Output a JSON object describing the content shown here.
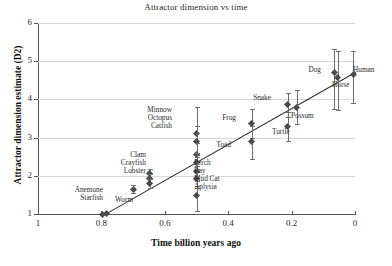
{
  "chart_data": {
    "type": "scatter",
    "title": "Attractor dimension vs time",
    "xlabel": "Time billion years ago",
    "ylabel": "Attractor dimension estimate (D2)",
    "xlim": [
      1,
      0
    ],
    "ylim": [
      1,
      6
    ],
    "x_ticks": [
      "1",
      "0.8",
      "0.6",
      "0.4",
      "0.2",
      "0"
    ],
    "y_ticks": [
      "1",
      "2",
      "3",
      "4",
      "5",
      "6"
    ],
    "x_axis_reversed": true,
    "grid": "horizontal",
    "legend": "none",
    "trendline": {
      "x1": 0.79,
      "y1": 1.0,
      "x2": 0.0,
      "y2": 4.72
    },
    "points": [
      {
        "name": "Anemone",
        "x": 0.795,
        "y": 1.0,
        "err_low": 0.0,
        "err_high": 0.0
      },
      {
        "name": "Starfish",
        "x": 0.785,
        "y": 1.02,
        "err_low": 0.0,
        "err_high": 0.0
      },
      {
        "name": "Worm",
        "x": 0.7,
        "y": 1.65,
        "err_low": 0.1,
        "err_high": 0.1
      },
      {
        "name": "Clam",
        "x": 0.648,
        "y": 2.05,
        "err_low": 0.12,
        "err_high": 0.12
      },
      {
        "name": "Crayfish",
        "x": 0.648,
        "y": 1.92,
        "err_low": 0.12,
        "err_high": 0.12
      },
      {
        "name": "Lobster",
        "x": 0.648,
        "y": 1.8,
        "err_low": 0.12,
        "err_high": 0.12
      },
      {
        "name": "Minnow",
        "x": 0.5,
        "y": 3.1,
        "err_low": 0.55,
        "err_high": 0.7
      },
      {
        "name": "Octopus",
        "x": 0.5,
        "y": 2.9,
        "err_low": 0.4,
        "err_high": 0.4
      },
      {
        "name": "Catfish",
        "x": 0.5,
        "y": 2.55,
        "err_low": 0.3,
        "err_high": 0.3
      },
      {
        "name": "Perch",
        "x": 0.5,
        "y": 2.35,
        "err_low": 0.25,
        "err_high": 0.25
      },
      {
        "name": "Ray",
        "x": 0.5,
        "y": 2.12,
        "err_low": 0.25,
        "err_high": 0.25
      },
      {
        "name": "Mud Cat",
        "x": 0.5,
        "y": 1.92,
        "err_low": 0.25,
        "err_high": 0.25
      },
      {
        "name": "Aplysia",
        "x": 0.5,
        "y": 1.48,
        "err_low": 0.4,
        "err_high": 0.25
      },
      {
        "name": "Frog",
        "x": 0.325,
        "y": 3.38,
        "err_low": 0.38,
        "err_high": 0.38
      },
      {
        "name": "Toad",
        "x": 0.325,
        "y": 2.9,
        "err_low": 0.45,
        "err_high": 0.4
      },
      {
        "name": "Snake",
        "x": 0.212,
        "y": 3.86,
        "err_low": 0.32,
        "err_high": 0.32
      },
      {
        "name": "Turtle",
        "x": 0.212,
        "y": 3.28,
        "err_low": 0.38,
        "err_high": 0.38
      },
      {
        "name": "Possum",
        "x": 0.183,
        "y": 3.8,
        "err_low": 0.45,
        "err_high": 0.45
      },
      {
        "name": "Dog",
        "x": 0.065,
        "y": 4.7,
        "err_low": 0.95,
        "err_high": 0.62
      },
      {
        "name": "Horse",
        "x": 0.055,
        "y": 4.58,
        "err_low": 0.85,
        "err_high": 0.7
      },
      {
        "name": "Human",
        "x": 0.005,
        "y": 4.66,
        "err_low": 0.75,
        "err_high": 0.6
      }
    ],
    "annotations": [
      {
        "text": "Anemone",
        "align": "right"
      },
      {
        "text": "Starfish",
        "align": "right"
      },
      {
        "text": "Worm",
        "align": "left"
      },
      {
        "text": "Clam",
        "align": "right"
      },
      {
        "text": "Crayfish",
        "align": "right"
      },
      {
        "text": "Lobster",
        "align": "right"
      },
      {
        "text": "Minnow",
        "align": "right"
      },
      {
        "text": "Octopus",
        "align": "right"
      },
      {
        "text": "Catfish",
        "align": "right"
      },
      {
        "text": "Perch",
        "align": "left"
      },
      {
        "text": "Ray",
        "align": "left"
      },
      {
        "text": "Mud Cat",
        "align": "left"
      },
      {
        "text": "Aplysia",
        "align": "left"
      },
      {
        "text": "Frog",
        "align": "right"
      },
      {
        "text": "Toad",
        "align": "right"
      },
      {
        "text": "Snake",
        "align": "right"
      },
      {
        "text": "Turtle",
        "align": "left"
      },
      {
        "text": "Possum",
        "align": "left"
      },
      {
        "text": "Dog",
        "align": "right"
      },
      {
        "text": "Horse",
        "align": "left"
      },
      {
        "text": "Human",
        "align": "left"
      }
    ]
  },
  "labels": {
    "anemone": "Anemone",
    "starfish": "Starfish",
    "worm": "Worm",
    "clam": "Clam",
    "crayfish": "Crayfish",
    "lobster": "Lobster",
    "minnow": "Minnow",
    "octopus": "Octopus",
    "catfish": "Catfish",
    "perch": "Perch",
    "ray": "Ray",
    "mudcat": "Mud Cat",
    "aplysia": "Aplysia",
    "frog": "Frog",
    "toad": "Toad",
    "snake": "Snake",
    "turtle": "Turtle",
    "possum": "Possum",
    "dog": "Dog",
    "horse": "Horse",
    "human": "Human"
  },
  "colors": {
    "marker": "#4a4a4a",
    "errorbar": "#6d6d6d",
    "trendline": "#2a2a2a",
    "grid": "#d8d8d8",
    "axis": "#555555",
    "text": "#2b2b2b",
    "background": "#ffffff"
  }
}
